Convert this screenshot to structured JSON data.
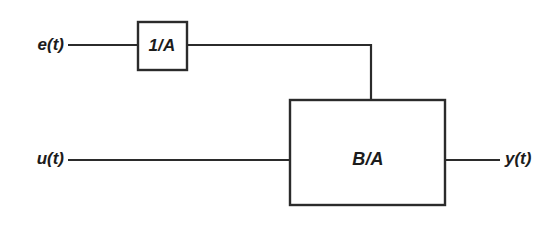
{
  "figure": {
    "kind": "block-diagram",
    "background_color": "#ffffff",
    "line_color": "#2b2b2b",
    "text_color": "#1c1c1c"
  },
  "blocks": [
    {
      "id": "inverse-a",
      "label": "1/A",
      "x": 138,
      "y": 22,
      "width": 49,
      "height": 48,
      "label_x": 162,
      "label_y": 47
    },
    {
      "id": "b-over-a",
      "label": "B/A",
      "x": 290,
      "y": 100,
      "width": 155,
      "height": 105,
      "label_x": 368,
      "label_y": 160
    }
  ],
  "signals": [
    {
      "id": "noise-input",
      "label": "e(t)",
      "label_x": 64,
      "label_y": 46
    },
    {
      "id": "control-input",
      "label": "u(t)",
      "label_x": 64,
      "label_y": 160
    },
    {
      "id": "output",
      "label": "y(t)",
      "label_x": 505,
      "label_y": 160
    }
  ],
  "wires": [
    {
      "id": "wire-e-to-inverse-a",
      "d": "M 68 45 L 138 45"
    },
    {
      "id": "wire-inverse-a-to-corner",
      "d": "M 187 45 L 372 45"
    },
    {
      "id": "wire-corner-down-to-ba-top",
      "d": "M 371 44 L 371 100"
    },
    {
      "id": "wire-u-to-ba",
      "d": "M 68 160 L 290 160"
    },
    {
      "id": "wire-ba-to-y",
      "d": "M 445 160 L 500 160"
    }
  ]
}
